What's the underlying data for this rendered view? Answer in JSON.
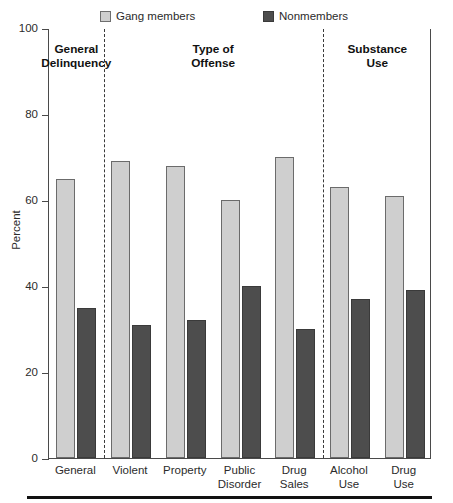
{
  "chart_data": {
    "type": "bar",
    "title": "",
    "xlabel": "",
    "ylabel": "Percent",
    "ylim": [
      0,
      100
    ],
    "yticks": [
      0,
      20,
      40,
      60,
      80,
      100
    ],
    "grid": false,
    "legend_position": "top",
    "categories": [
      "General",
      "Violent",
      "Property",
      "Public\nDisorder",
      "Drug\nSales",
      "Alcohol\nUse",
      "Drug\nUse"
    ],
    "sections": [
      {
        "label": "General\nDelinquency",
        "categories": [
          "General"
        ]
      },
      {
        "label": "Type of\nOffense",
        "categories": [
          "Violent",
          "Property",
          "Public Disorder",
          "Drug Sales"
        ]
      },
      {
        "label": "Substance\nUse",
        "categories": [
          "Alcohol Use",
          "Drug Use"
        ]
      }
    ],
    "series": [
      {
        "name": "Gang members",
        "color": "#cfcfcf",
        "values": [
          65,
          69,
          68,
          60,
          70,
          63,
          61
        ]
      },
      {
        "name": "Nonmembers",
        "color": "#4d4d4d",
        "values": [
          35,
          31,
          32,
          40,
          30,
          37,
          39
        ]
      }
    ]
  },
  "legend": {
    "items": [
      {
        "label": "Gang members",
        "swatch": "legend-swatch-gang-members"
      },
      {
        "label": "Nonmembers",
        "swatch": "legend-swatch-nonmembers"
      }
    ]
  },
  "axis": {
    "y_title": "Percent",
    "y_tick_labels": [
      "100",
      "80",
      "60",
      "40",
      "20",
      "0"
    ]
  },
  "sections": {
    "labels": [
      "General\nDelinquency",
      "Type of\nOffense",
      "Substance\nUse"
    ]
  },
  "categories": {
    "labels": [
      "General",
      "Violent",
      "Property",
      "Public\nDisorder",
      "Drug\nSales",
      "Alcohol\nUse",
      "Drug\nUse"
    ]
  }
}
